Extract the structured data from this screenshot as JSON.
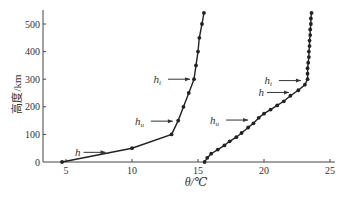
{
  "chart_data": {
    "type": "line",
    "title": "",
    "xlabel": "θ/℃",
    "ylabel": "高度/km",
    "xlim": [
      3,
      25
    ],
    "ylim": [
      0,
      550
    ],
    "xticks": [
      5,
      10,
      15,
      20,
      25
    ],
    "yticks": [
      0,
      100,
      200,
      300,
      400,
      500
    ],
    "grid": false,
    "legend": null,
    "series": [
      {
        "name": "profile-1",
        "marker": "dot",
        "points": [
          [
            4.7,
            0
          ],
          [
            10,
            50
          ],
          [
            13,
            100
          ],
          [
            13.5,
            150
          ],
          [
            13.9,
            200
          ],
          [
            14.3,
            250
          ],
          [
            14.7,
            300
          ],
          [
            14.85,
            350
          ],
          [
            15.0,
            400
          ],
          [
            15.1,
            450
          ],
          [
            15.3,
            500
          ],
          [
            15.45,
            540
          ]
        ]
      },
      {
        "name": "profile-2",
        "marker": "dot",
        "points": [
          [
            15.5,
            0
          ],
          [
            15.7,
            15
          ],
          [
            16.0,
            30
          ],
          [
            16.5,
            45
          ],
          [
            17.0,
            60
          ],
          [
            17.4,
            75
          ],
          [
            17.9,
            90
          ],
          [
            18.3,
            105
          ],
          [
            18.8,
            125
          ],
          [
            19.2,
            140
          ],
          [
            19.6,
            160
          ],
          [
            20.0,
            175
          ],
          [
            20.5,
            190
          ],
          [
            21.0,
            205
          ],
          [
            21.5,
            220
          ],
          [
            22.0,
            240
          ],
          [
            22.6,
            260
          ],
          [
            23.1,
            280
          ],
          [
            23.3,
            300
          ],
          [
            23.3,
            320
          ],
          [
            23.3,
            340
          ],
          [
            23.35,
            360
          ],
          [
            23.4,
            380
          ],
          [
            23.4,
            400
          ],
          [
            23.45,
            420
          ],
          [
            23.45,
            440
          ],
          [
            23.5,
            460
          ],
          [
            23.5,
            480
          ],
          [
            23.55,
            500
          ],
          [
            23.55,
            520
          ],
          [
            23.6,
            540
          ]
        ]
      }
    ],
    "annotations": [
      {
        "text": "h",
        "target_series": "profile-1",
        "x": 8.3,
        "y": 35
      },
      {
        "text": "h_u",
        "target_series": "profile-1",
        "x": 13.4,
        "y": 148
      },
      {
        "text": "h_i",
        "target_series": "profile-1",
        "x": 14.7,
        "y": 300
      },
      {
        "text": "h_u",
        "target_series": "profile-2",
        "x": 19.1,
        "y": 152
      },
      {
        "text": "h",
        "target_series": "profile-2",
        "x": 22.2,
        "y": 252
      },
      {
        "text": "h_i",
        "target_series": "profile-2",
        "x": 23.1,
        "y": 295
      }
    ]
  }
}
